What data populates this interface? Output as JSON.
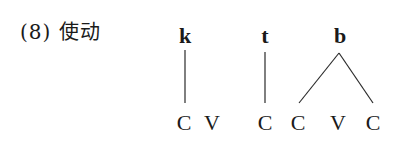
{
  "example": {
    "number": "(8)",
    "label": "使动",
    "full_label": "(8) 使动"
  },
  "diagram": {
    "top_tier": [
      {
        "id": "k",
        "text": "k",
        "x": 185
      },
      {
        "id": "t",
        "text": "t",
        "x": 265
      },
      {
        "id": "b",
        "text": "b",
        "x": 340
      }
    ],
    "bottom_tier": [
      {
        "text": "C",
        "x": 184
      },
      {
        "text": "V",
        "x": 212
      },
      {
        "text": "C",
        "x": 265
      },
      {
        "text": "C",
        "x": 298
      },
      {
        "text": "V",
        "x": 338
      },
      {
        "text": "C",
        "x": 373
      }
    ],
    "associations": [
      {
        "from": "k",
        "to_index": 0
      },
      {
        "from": "t",
        "to_index": 2
      },
      {
        "from": "b",
        "to_index": 3
      },
      {
        "from": "b",
        "to_index": 5
      }
    ]
  }
}
